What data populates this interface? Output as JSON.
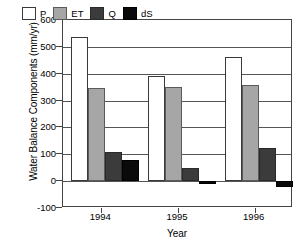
{
  "chart_data": {
    "type": "bar",
    "title": "",
    "xlabel": "Year",
    "ylabel": "Water Balance Components (mm/yr)",
    "categories": [
      "1994",
      "1995",
      "1996"
    ],
    "series": [
      {
        "name": "P",
        "label": "P",
        "color": "#ffffff",
        "values": [
          535,
          390,
          463
        ]
      },
      {
        "name": "ET",
        "label": "ET",
        "color": "#a6a6a6",
        "values": [
          345,
          352,
          358
        ]
      },
      {
        "name": "Q",
        "label": "Q",
        "color": "#3b3b3b",
        "values": [
          110,
          48,
          125
        ]
      },
      {
        "name": "dS",
        "label": "dS",
        "color": "#0a0a0a",
        "values": [
          78,
          -10,
          -20
        ]
      }
    ],
    "ylim": [
      -100,
      600
    ],
    "ytick_step": 100,
    "yticks": [
      -100,
      0,
      100,
      200,
      300,
      400,
      500,
      600
    ],
    "ytick_labels": [
      "-100",
      "0",
      "100",
      "200",
      "300",
      "400",
      "500",
      "600"
    ],
    "grid": true,
    "grid_axis": "y",
    "legend_position": "top-inside",
    "legend_entries": [
      "P",
      "ET",
      "Q",
      "dS"
    ]
  }
}
